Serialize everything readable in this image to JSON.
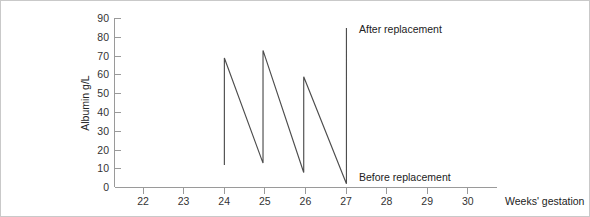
{
  "chart_data": {
    "type": "line",
    "title": "",
    "subtitle": "",
    "xlabel": "Weeks' gestation",
    "ylabel": "Albumin g/L",
    "xlim": [
      21.3,
      30.7
    ],
    "ylim": [
      0,
      90
    ],
    "grid": false,
    "legend_position": "none",
    "x_ticks": [
      22,
      23,
      24,
      25,
      26,
      27,
      28,
      29,
      30
    ],
    "x_tick_labels": [
      "22",
      "23",
      "24",
      "25",
      "26",
      "27",
      "28",
      "29",
      "30"
    ],
    "y_ticks": [
      0,
      10,
      20,
      30,
      40,
      50,
      60,
      70,
      80,
      90
    ],
    "y_tick_labels": [
      "0",
      "10",
      "20",
      "30",
      "40",
      "50",
      "60",
      "70",
      "80",
      "90"
    ],
    "series": [
      {
        "name": "Albumin",
        "color": "#4d4d4d",
        "points": [
          {
            "x": 24.0,
            "y": 12
          },
          {
            "x": 24.0,
            "y": 69
          },
          {
            "x": 24.95,
            "y": 13
          },
          {
            "x": 24.95,
            "y": 73
          },
          {
            "x": 25.95,
            "y": 8
          },
          {
            "x": 25.95,
            "y": 59
          },
          {
            "x": 27.0,
            "y": 2
          },
          {
            "x": 27.0,
            "y": 85
          }
        ]
      }
    ],
    "annotations": [
      {
        "id": "after-replacement",
        "text": "After replacement",
        "x": 27.15,
        "y": 82
      },
      {
        "id": "before-replacement",
        "text": "Before replacement",
        "x": 27.15,
        "y": 5
      }
    ]
  },
  "colors": {
    "data_line": "#4d4d4d",
    "axis": "#9a9a9a",
    "text": "#222222",
    "tick_text": "#333333",
    "frame": "#c9c9c9",
    "background": "#ffffff"
  }
}
